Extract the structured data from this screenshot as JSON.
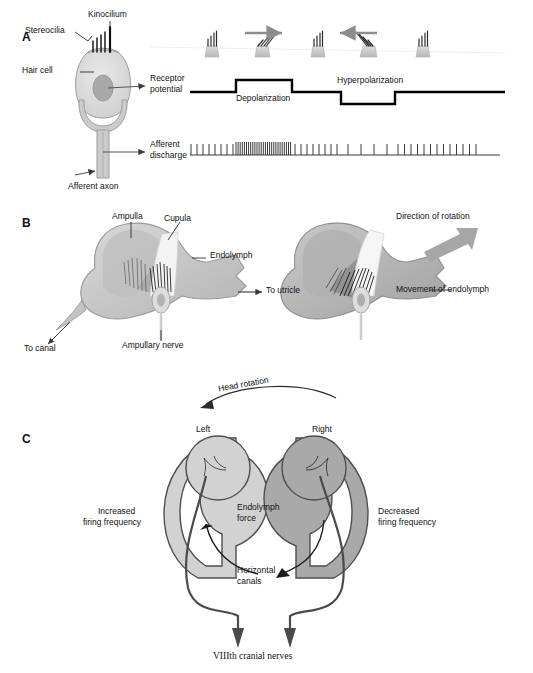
{
  "figure": {
    "domain": "scientific-diagram",
    "panels": [
      "A",
      "B",
      "C"
    ]
  },
  "colors": {
    "ink": "#111111",
    "trace": "#000000",
    "arrow_gray": "#8c8c8c",
    "cell_fill": "#d8d8d8",
    "cell_stroke": "#9a9a9a",
    "nucleus": "#a8a8a8",
    "ampulla_light": "#cccccc",
    "ampulla_mid": "#bdbdbd",
    "ampulla_dark": "#9e9e9e",
    "canal_left": "#d2d2d2",
    "canal_right": "#a9a9a9",
    "canal_stroke": "#555555",
    "nerve_line": "#444444"
  },
  "panelA": {
    "letter": "A",
    "labels": {
      "kinocilium": "Kinocilium",
      "stereocilia": "Stereocilia",
      "hair_cell": "Hair cell",
      "receptor_potential_line1": "Receptor",
      "receptor_potential_line2": "potential",
      "afferent_discharge_line1": "Afferent",
      "afferent_discharge_line2": "discharge",
      "afferent_axon": "Afferent axon",
      "depolarization": "Depolarization",
      "hyperpolarization": "Hyperpolarization"
    },
    "bundles": [
      {
        "state": "resting",
        "tilt": 0,
        "x": 212
      },
      {
        "state": "deflected-toward-kinocilium",
        "tilt": 32,
        "x": 263
      },
      {
        "state": "resting",
        "tilt": 0,
        "x": 318
      },
      {
        "state": "deflected-away-from-kinocilium",
        "tilt": -34,
        "x": 368
      },
      {
        "state": "resting",
        "tilt": 0,
        "x": 423
      }
    ],
    "bundle_arrows": [
      {
        "name": "rightward-deflection-arrow",
        "direction": "right",
        "x": 248,
        "y": 33
      },
      {
        "name": "leftward-deflection-arrow",
        "direction": "left",
        "x": 344,
        "y": 33
      }
    ],
    "trace": {
      "baseline_y": 92,
      "depolarized_y": 80,
      "hyperpolarized_y": 104,
      "x_start": 190,
      "x_end": 505,
      "depol_from": 236,
      "depol_to": 292,
      "hyper_from": 341,
      "hyper_to": 395
    },
    "spike_train": {
      "axis_y": 155,
      "x_start": 190,
      "x_end": 500,
      "segments": [
        {
          "name": "baseline-firing",
          "from": 190,
          "to": 236,
          "spacing": 6.0,
          "height": 11
        },
        {
          "name": "increased-firing",
          "from": 236,
          "to": 292,
          "spacing": 2.1,
          "height": 13
        },
        {
          "name": "baseline-firing",
          "from": 292,
          "to": 341,
          "spacing": 6.0,
          "height": 11
        },
        {
          "name": "decreased-firing",
          "from": 341,
          "to": 395,
          "spacing": 13.0,
          "height": 11
        },
        {
          "name": "baseline-firing",
          "from": 395,
          "to": 498,
          "spacing": 6.5,
          "height": 11
        }
      ]
    }
  },
  "panelB": {
    "letter": "B",
    "labels": {
      "ampulla": "Ampulla",
      "cupula": "Cupula",
      "endolymph": "Endolymph",
      "to_utricle": "To utricle",
      "to_canal": "To canal",
      "ampullary_nerve": "Ampullary nerve",
      "direction_of_rotation": "Direction of rotation",
      "movement_of_endolymph": "Movement of endolymph"
    },
    "views": [
      {
        "name": "ampulla-at-rest",
        "cupula_state": "upright"
      },
      {
        "name": "ampulla-during-rotation",
        "cupula_state": "deflected"
      }
    ]
  },
  "panelC": {
    "letter": "C",
    "labels": {
      "head_rotation": "Head rotation",
      "left": "Left",
      "right": "Right",
      "endolymph_force_line1": "Endolymph",
      "endolymph_force_line2": "force",
      "horizontal_canals_line1": "Horizontal",
      "horizontal_canals_line2": "canals",
      "increased_firing_line1": "Increased",
      "increased_firing_line2": "firing frequency",
      "decreased_firing_line1": "Decreased",
      "decreased_firing_line2": "firing frequency",
      "cranial_nerves": "VIIIth cranial nerves"
    }
  }
}
